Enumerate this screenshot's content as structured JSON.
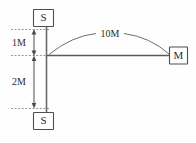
{
  "diagram": {
    "background_color": "#fefefe",
    "line_color": "#555555",
    "text_color": "#2b2b2b",
    "nodes": {
      "top_support": {
        "label": "S",
        "name": "top-support-box"
      },
      "bottom_support": {
        "label": "S",
        "name": "bottom-support-box"
      },
      "mass": {
        "label": "M",
        "name": "mass-box"
      }
    },
    "dimensions": {
      "upper_segment": {
        "label": "1M",
        "value": 1,
        "unit": "M"
      },
      "lower_segment": {
        "label": "2M",
        "value": 2,
        "unit": "M"
      },
      "beam_span": {
        "label": "10M",
        "value": 10,
        "unit": "M"
      }
    }
  }
}
